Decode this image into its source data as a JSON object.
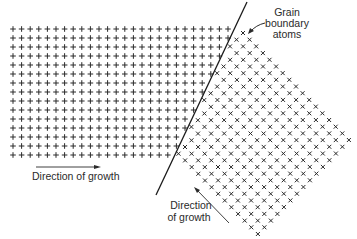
{
  "figure": {
    "colors": {
      "ink": "#2a2a2a",
      "background": "#ffffff"
    }
  },
  "labels": {
    "grain_boundary": [
      "Grain",
      "boundary",
      "atoms"
    ],
    "growth_left": "Direction of growth",
    "growth_right": [
      "Direction",
      "of growth"
    ]
  },
  "grain_left": {
    "symbol": "+",
    "origin": [
      13,
      29
    ],
    "dx": 8.6,
    "dy": 9,
    "rows": 15,
    "cols": 27
  },
  "grain_right": {
    "symbol": "x",
    "top_vertex": [
      243,
      33
    ],
    "a": [
      6.62,
      6.69
    ],
    "b": [
      -6.5,
      6.71
    ],
    "n_a": 17,
    "n_b": 15
  },
  "boundary_line": {
    "x1": 247,
    "y1": 2,
    "x2": 156,
    "y2": 195
  }
}
